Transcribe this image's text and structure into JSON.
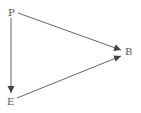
{
  "diagram": {
    "nodes": [
      {
        "id": "P",
        "label": "P",
        "x": 9,
        "y": 16
      },
      {
        "id": "B",
        "label": "B",
        "x": 125,
        "y": 54
      },
      {
        "id": "E",
        "label": "E",
        "x": 7,
        "y": 104
      }
    ],
    "edges": [
      {
        "from": "P",
        "to": "B"
      },
      {
        "from": "P",
        "to": "E"
      },
      {
        "from": "E",
        "to": "B"
      }
    ],
    "colors": {
      "line": "#555555",
      "text": "#555555",
      "background": "#ffffff"
    }
  }
}
